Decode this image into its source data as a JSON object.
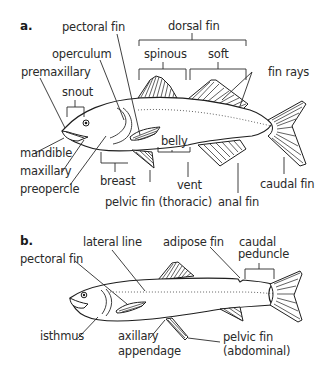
{
  "diagram_a": {
    "panel_label": "a.",
    "labels": {
      "pectoral_fin": "pectoral fin",
      "dorsal_fin": "dorsal fin",
      "spinous": "spinous",
      "soft": "soft",
      "operculum": "operculum",
      "fin_rays": "fin rays",
      "premaxillary": "premaxillary",
      "snout": "snout",
      "mandible": "mandible",
      "maxillary": "maxillary",
      "preopercle": "preopercle",
      "belly": "belly",
      "breast": "breast",
      "vent": "vent",
      "caudal_fin": "caudal fin",
      "pelvic_fin_thoracic": "pelvic fin (thoracic)",
      "anal_fin": "anal fin"
    }
  },
  "diagram_b": {
    "panel_label": "b.",
    "labels": {
      "lateral_line": "lateral line",
      "adipose_fin": "adipose fin",
      "caudal": "caudal",
      "peduncle": "peduncle",
      "pectoral_fin": "pectoral fin",
      "isthmus": "isthmus",
      "axillary": "axillary",
      "appendage": "appendage",
      "pelvic_fin": "pelvic fin",
      "abdominal": "(abdominal)"
    }
  }
}
